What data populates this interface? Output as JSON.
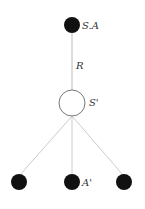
{
  "diagram": {
    "type": "tree",
    "colors": {
      "filled_node": "#111111",
      "hollow_node_stroke": "#777777",
      "edge": "#bbbbbb",
      "label": "#333333"
    },
    "nodes": [
      {
        "id": "top",
        "label": "S.A",
        "style": "filled"
      },
      {
        "id": "middle",
        "label": "S'",
        "style": "hollow"
      },
      {
        "id": "bottom-left",
        "label": "",
        "style": "filled"
      },
      {
        "id": "bottom-center",
        "label": "A'",
        "style": "filled"
      },
      {
        "id": "bottom-right",
        "label": "",
        "style": "filled"
      }
    ],
    "edges": [
      {
        "from": "top",
        "to": "middle",
        "label": "R"
      },
      {
        "from": "middle",
        "to": "bottom-left",
        "label": ""
      },
      {
        "from": "middle",
        "to": "bottom-center",
        "label": ""
      },
      {
        "from": "middle",
        "to": "bottom-right",
        "label": ""
      }
    ],
    "labels": {
      "top_node": "S.A",
      "edge_top_middle": "R",
      "middle_node": "S'",
      "bottom_center_node": "A'"
    }
  }
}
